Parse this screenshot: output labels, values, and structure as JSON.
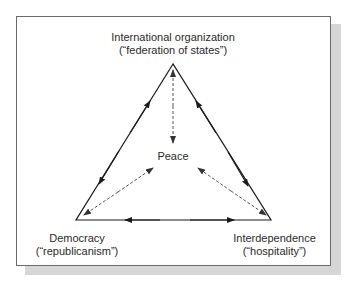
{
  "diagram": {
    "type": "triangle-relationship",
    "nodes": {
      "top": {
        "title": "International organization",
        "subtitle": "(“federation of states”)"
      },
      "bottom_left": {
        "title": "Democracy",
        "subtitle": "(“republicanism”)"
      },
      "bottom_right": {
        "title": "Interdependence",
        "subtitle": "(“hospitality”)"
      },
      "center": {
        "title": "Peace"
      }
    },
    "edges": [
      {
        "from": "top",
        "to": "bottom_left",
        "style": "solid",
        "direction": "bidirectional"
      },
      {
        "from": "top",
        "to": "bottom_right",
        "style": "solid",
        "direction": "bidirectional"
      },
      {
        "from": "bottom_left",
        "to": "bottom_right",
        "style": "solid",
        "direction": "bidirectional"
      },
      {
        "from": "center",
        "to": "top",
        "style": "dashed",
        "direction": "bidirectional"
      },
      {
        "from": "center",
        "to": "bottom_left",
        "style": "dashed",
        "direction": "bidirectional"
      },
      {
        "from": "center",
        "to": "bottom_right",
        "style": "dashed",
        "direction": "bidirectional"
      }
    ],
    "colors": {
      "line": "#1a1a1a",
      "dashed": "#555555",
      "frame": "#6a6a6a",
      "shadow": "#d6d6d6",
      "text": "#2a2a2a"
    }
  }
}
